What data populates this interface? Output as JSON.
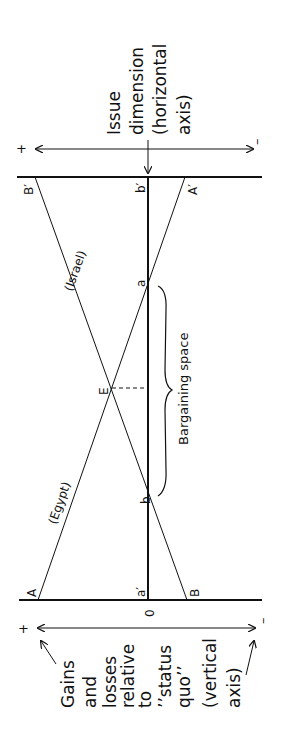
{
  "figure": {
    "orientation": "rotated-90-ccw",
    "colors": {
      "ink": "#111111",
      "background": "#ffffff"
    },
    "horizontal_axis_label": [
      "Issue",
      "dimension",
      "(horizontal",
      "axis)"
    ],
    "vertical_axis_label": [
      "Gains",
      "and",
      "losses",
      "relative",
      "to",
      "’’status",
      "quo’’",
      "(vertical",
      "axis)"
    ],
    "plus_sign": "+",
    "minus_sign": "–",
    "origin_label": "0",
    "points": {
      "A": "A",
      "A_prime": "A′",
      "B": "B",
      "B_prime": "B′",
      "a": "a",
      "a_prime": "a′",
      "b": "b",
      "b_prime": "b′",
      "E": "E"
    },
    "lines": {
      "egypt": "(Egypt)",
      "israel": "(Israel)"
    },
    "bargaining_space": "Bargaining space"
  }
}
